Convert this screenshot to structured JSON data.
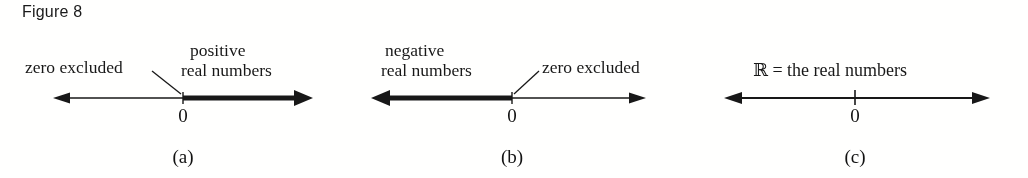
{
  "figure": {
    "caption": "Figure 8"
  },
  "panels": [
    {
      "id": "a",
      "sub_label": "(a)",
      "zero_label": "0",
      "annotations": [
        {
          "name": "zero-excluded-label",
          "text": "zero excluded"
        },
        {
          "name": "positive-real-numbers-label-line1",
          "text": "positive"
        },
        {
          "name": "positive-real-numbers-label-line2",
          "text": "real numbers"
        }
      ],
      "highlight": "right",
      "tick_style": "bold-start"
    },
    {
      "id": "b",
      "sub_label": "(b)",
      "zero_label": "0",
      "annotations": [
        {
          "name": "negative-real-numbers-label-line1",
          "text": "negative"
        },
        {
          "name": "negative-real-numbers-label-line2",
          "text": "real numbers"
        },
        {
          "name": "zero-excluded-label",
          "text": "zero excluded"
        }
      ],
      "highlight": "left",
      "tick_style": "bold-end"
    },
    {
      "id": "c",
      "sub_label": "(c)",
      "zero_label": "0",
      "annotations": [
        {
          "name": "real-numbers-set-label",
          "text": "ℝ = the real numbers"
        }
      ],
      "highlight": "none",
      "tick_style": "plain"
    }
  ],
  "colors": {
    "ink": "#1a1a1a",
    "page": "#fdfdfc"
  }
}
